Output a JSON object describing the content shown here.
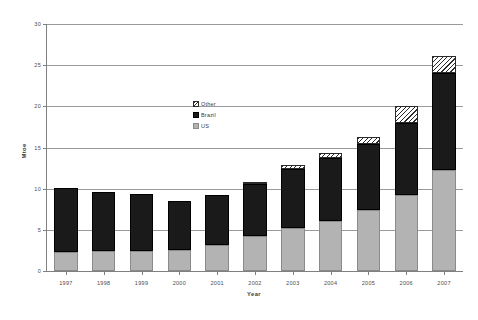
{
  "chart_data": {
    "type": "bar",
    "stacked": true,
    "title": "",
    "xlabel": "Year",
    "ylabel": "Mtoe",
    "categories": [
      "1997",
      "1998",
      "1999",
      "2000",
      "2001",
      "2002",
      "2003",
      "2004",
      "2005",
      "2006",
      "2007"
    ],
    "series": [
      {
        "name": "US",
        "values": [
          2.3,
          2.4,
          2.4,
          2.5,
          3.1,
          4.3,
          5.2,
          6.1,
          7.4,
          9.2,
          12.3
        ]
      },
      {
        "name": "Brazil",
        "values": [
          7.8,
          7.2,
          6.9,
          6.0,
          6.1,
          6.3,
          7.2,
          7.6,
          8.0,
          8.8,
          11.8
        ]
      },
      {
        "name": "Other",
        "values": [
          0.0,
          0.0,
          0.0,
          0.0,
          0.0,
          0.2,
          0.5,
          0.6,
          0.9,
          2.1,
          2.0
        ]
      }
    ],
    "totals": [
      10.1,
      9.6,
      9.3,
      8.5,
      9.2,
      10.8,
      12.9,
      14.3,
      16.3,
      20.1,
      26.1
    ],
    "ylim": [
      0,
      30
    ],
    "yticks": [
      0,
      5,
      10,
      15,
      20,
      25,
      30
    ],
    "ytick_labels": [
      "0",
      "5",
      "10",
      "15",
      "20",
      "25",
      "30"
    ],
    "grid": true,
    "grid_axis": "y",
    "legend_position": "inside-center",
    "legend": [
      {
        "label": "Other",
        "swatch": "hatched-diagonal",
        "color": "#ffffff"
      },
      {
        "label": "Brazil",
        "swatch": "solid",
        "color": "#1a1a1a"
      },
      {
        "label": "US",
        "swatch": "solid",
        "color": "#b3b3b3"
      }
    ]
  },
  "colors": {
    "us": "#b3b3b3",
    "brazil": "#1a1a1a",
    "other": "#ffffff",
    "axis": "#808080",
    "grid": "#9a9a9a",
    "text": "#3a3a3a",
    "background": "#ffffff"
  }
}
